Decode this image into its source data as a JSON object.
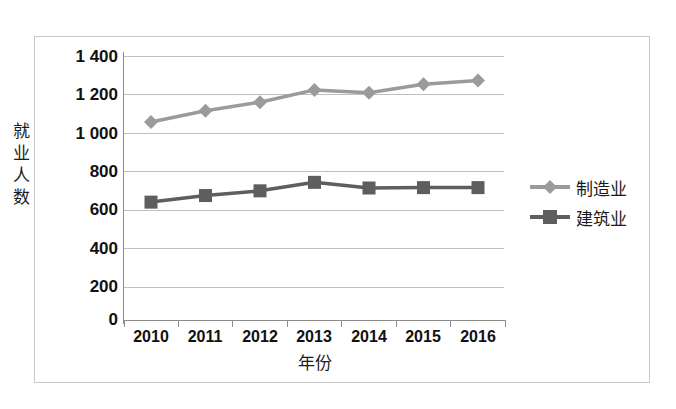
{
  "chart_data": {
    "type": "line",
    "title": "",
    "xlabel": "年份",
    "ylabel": "就业人数",
    "categories": [
      "2010",
      "2011",
      "2012",
      "2013",
      "2014",
      "2015",
      "2016"
    ],
    "series": [
      {
        "name": "制造业",
        "marker": "diamond",
        "color": "#9b9b9b",
        "values": [
          1050,
          1110,
          1155,
          1220,
          1205,
          1250,
          1270
        ]
      },
      {
        "name": "建筑业",
        "marker": "square",
        "color": "#5e5e5e",
        "values": [
          625,
          660,
          685,
          730,
          700,
          702,
          702
        ]
      }
    ],
    "ylim": [
      0,
      1400
    ],
    "ytick_labels": [
      "1 400",
      "1 200",
      "1 000",
      "800",
      "600",
      "400",
      "200",
      "0"
    ],
    "ytick_values": [
      1400,
      1200,
      1000,
      800,
      600,
      400,
      200,
      0
    ],
    "grid": true,
    "legend_position": "right",
    "axis_color": "#8c8c8c",
    "grid_color": "#bfbfbf",
    "border_color": "#c9c9c9"
  },
  "axis": {
    "y_title_chars": [
      "就",
      "业",
      "人",
      "数"
    ],
    "x_title": "年份"
  },
  "legend": {
    "items": [
      {
        "label": "制造业"
      },
      {
        "label": "建筑业"
      }
    ]
  }
}
